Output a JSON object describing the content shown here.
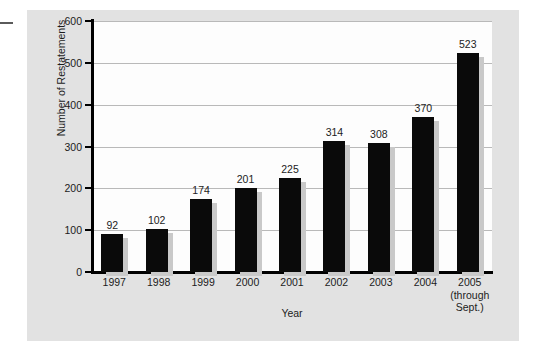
{
  "chart_data": {
    "type": "bar",
    "title": "",
    "xlabel": "Year",
    "ylabel": "Number of Restatements",
    "categories": [
      "1997",
      "1998",
      "1999",
      "2000",
      "2001",
      "2002",
      "2003",
      "2004",
      "2005"
    ],
    "category_sublabels": [
      [
        "1997"
      ],
      [
        "1998"
      ],
      [
        "1999"
      ],
      [
        "2000"
      ],
      [
        "2001"
      ],
      [
        "2002"
      ],
      [
        "2003"
      ],
      [
        "2004"
      ],
      [
        "2005",
        "(through",
        "Sept.)"
      ]
    ],
    "values": [
      92,
      102,
      174,
      201,
      225,
      314,
      308,
      370,
      523
    ],
    "value_labels": [
      "92",
      "102",
      "174",
      "201",
      "225",
      "314",
      "308",
      "370",
      "523"
    ],
    "ylim": [
      0,
      600
    ],
    "yticks": [
      0,
      100,
      200,
      300,
      400,
      500,
      600
    ],
    "ytick_labels": [
      "0",
      "100",
      "200",
      "300",
      "400",
      "500",
      "600"
    ],
    "grid": "horizontal",
    "legend": "none",
    "bar_color": "#0a0a0a",
    "bar_shadow_color": "#c9c9c9",
    "gridline_color": "#b9b9b9",
    "axis_color": "#000000",
    "panel_color": "#e2e2e2",
    "plot_background": "#fdfdfd"
  }
}
